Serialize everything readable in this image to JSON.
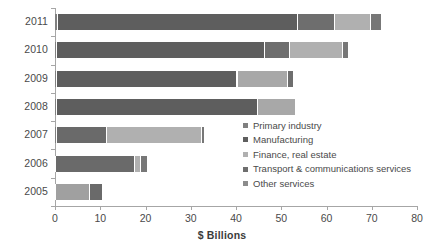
{
  "chart_data": {
    "type": "bar",
    "orientation": "horizontal",
    "stacked": true,
    "title": "",
    "xlabel": "$ Billions",
    "ylabel": "",
    "xlim": [
      0,
      80
    ],
    "xticks": [
      0,
      10,
      20,
      30,
      40,
      50,
      60,
      70,
      80
    ],
    "grid": false,
    "legend_position": "inside-right",
    "categories": [
      "2011",
      "2010",
      "2009",
      "2008",
      "2007",
      "2006",
      "2005"
    ],
    "series": [
      {
        "name": "Primary industry",
        "color": "#808080",
        "values": [
          0.6,
          0.5,
          0.4,
          0.5,
          0.4,
          0.3,
          0.3
        ]
      },
      {
        "name": "Manufacturing",
        "color": "#5e5e5e",
        "values": [
          53.0,
          45.9,
          39.8,
          44.3,
          11.1,
          17.4,
          7.4
        ]
      },
      {
        "name": "Finance, real estate",
        "color": "#a8a8a8",
        "values": [
          8.2,
          5.5,
          0.3,
          7.5,
          30.9,
          0.4,
          0.0
        ]
      },
      {
        "name": "Transport & communications services",
        "color": "#6e6e6e",
        "values": [
          0.0,
          0.0,
          0.0,
          0.0,
          0.0,
          0.0,
          0.0
        ]
      },
      {
        "name": "Other services",
        "color": "#8c8c8c",
        "values": [
          8.0,
          11.7,
          11.2,
          0.0,
          0.6,
          1.1,
          2.7
        ]
      }
    ],
    "totals": [
      72.0,
      64.7,
      52.5,
      53.0,
      33.0,
      20.3,
      10.4
    ],
    "bars": [
      {
        "category": "2011",
        "total": 72.0,
        "segments": [
          {
            "series": "Primary industry",
            "value": 0.6,
            "color": "#808080"
          },
          {
            "series": "Manufacturing",
            "value": 53.0,
            "color": "#5e5e5e"
          },
          {
            "series": "Finance, real estate",
            "value": 8.2,
            "color": "#6e6e6e"
          },
          {
            "series": "Other services",
            "value": 8.0,
            "color": "#b0b0b0"
          },
          {
            "series": "Transport & communications services",
            "value": 2.2,
            "color": "#777777"
          }
        ]
      },
      {
        "category": "2010",
        "total": 64.7,
        "segments": [
          {
            "series": "Primary industry",
            "value": 0.5,
            "color": "#808080"
          },
          {
            "series": "Manufacturing",
            "value": 45.9,
            "color": "#5e5e5e"
          },
          {
            "series": "Finance, real estate",
            "value": 5.5,
            "color": "#6e6e6e"
          },
          {
            "series": "Other services",
            "value": 11.7,
            "color": "#b0b0b0"
          },
          {
            "series": "Transport & communications services",
            "value": 1.1,
            "color": "#777777"
          }
        ]
      },
      {
        "category": "2009",
        "total": 52.5,
        "segments": [
          {
            "series": "Primary industry",
            "value": 0.4,
            "color": "#808080"
          },
          {
            "series": "Manufacturing",
            "value": 39.8,
            "color": "#5e5e5e"
          },
          {
            "series": "Finance, real estate",
            "value": 0.3,
            "color": "#8a8a8a"
          },
          {
            "series": "Other services",
            "value": 11.0,
            "color": "#a8a8a8"
          },
          {
            "series": "Transport & communications services",
            "value": 1.0,
            "color": "#6e6e6e"
          }
        ]
      },
      {
        "category": "2008",
        "total": 53.0,
        "segments": [
          {
            "series": "Primary industry",
            "value": 0.5,
            "color": "#808080"
          },
          {
            "series": "Manufacturing",
            "value": 44.3,
            "color": "#5e5e5e"
          },
          {
            "series": "Other services",
            "value": 8.2,
            "color": "#a8a8a8"
          }
        ]
      },
      {
        "category": "2007",
        "total": 33.0,
        "segments": [
          {
            "series": "Primary industry",
            "value": 0.4,
            "color": "#808080"
          },
          {
            "series": "Manufacturing",
            "value": 11.1,
            "color": "#6a6a6a"
          },
          {
            "series": "Finance, real estate",
            "value": 20.9,
            "color": "#b0b0b0"
          },
          {
            "series": "Other services",
            "value": 0.6,
            "color": "#777777"
          }
        ]
      },
      {
        "category": "2006",
        "total": 20.3,
        "segments": [
          {
            "series": "Primary industry",
            "value": 0.3,
            "color": "#808080"
          },
          {
            "series": "Manufacturing",
            "value": 17.4,
            "color": "#6a6a6a"
          },
          {
            "series": "Finance, real estate",
            "value": 1.4,
            "color": "#b0b0b0"
          },
          {
            "series": "Other services",
            "value": 1.2,
            "color": "#777777"
          }
        ]
      },
      {
        "category": "2005",
        "total": 10.4,
        "segments": [
          {
            "series": "Primary industry",
            "value": 0.3,
            "color": "#909090"
          },
          {
            "series": "Manufacturing",
            "value": 7.4,
            "color": "#a0a0a0"
          },
          {
            "series": "Other services",
            "value": 2.7,
            "color": "#6a6a6a"
          }
        ]
      }
    ],
    "legend": [
      {
        "label": "Primary industry",
        "color": "#808080"
      },
      {
        "label": "Manufacturing",
        "color": "#5e5e5e"
      },
      {
        "label": "Finance, real estate",
        "color": "#b0b0b0"
      },
      {
        "label": "Transport & communications services",
        "color": "#6e6e6e"
      },
      {
        "label": "Other services",
        "color": "#8c8c8c"
      }
    ]
  }
}
